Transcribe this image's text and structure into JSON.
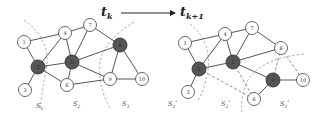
{
  "title_left": {
    "main": "t",
    "sub": "k"
  },
  "title_right": {
    "main": "t",
    "sub": "k+1"
  },
  "colors": {
    "dark_node": "#555555",
    "light_node": "#ffffff",
    "edge": "#444444"
  },
  "left_graph": {
    "nodes": [
      {
        "id": "1",
        "x": 24,
        "y": 42,
        "dark": false
      },
      {
        "id": "4",
        "x": 65,
        "y": 33,
        "dark": false
      },
      {
        "id": "7",
        "x": 90,
        "y": 25,
        "dark": false
      },
      {
        "id": "8",
        "x": 120,
        "y": 45,
        "dark": true
      },
      {
        "id": "2",
        "x": 38,
        "y": 67,
        "dark": true
      },
      {
        "id": "5",
        "x": 72,
        "y": 62,
        "dark": true
      },
      {
        "id": "3",
        "x": 25,
        "y": 90,
        "dark": false
      },
      {
        "id": "6",
        "x": 67,
        "y": 85,
        "dark": false
      },
      {
        "id": "9",
        "x": 110,
        "y": 79,
        "dark": false
      },
      {
        "id": "10",
        "x": 142,
        "y": 79,
        "dark": false
      }
    ],
    "sets": [
      {
        "label": "S",
        "sub": "1",
        "x": 36,
        "y": 108
      },
      {
        "label": "S",
        "sub": "2",
        "x": 73,
        "y": 106
      },
      {
        "label": "S",
        "sub": "3",
        "x": 122,
        "y": 106
      }
    ]
  },
  "right_graph": {
    "nodes": [
      {
        "id": "1",
        "x": 185,
        "y": 43,
        "dark": false
      },
      {
        "id": "4",
        "x": 225,
        "y": 34,
        "dark": false
      },
      {
        "id": "7",
        "x": 252,
        "y": 28,
        "dark": false
      },
      {
        "id": "8",
        "x": 281,
        "y": 48,
        "dark": false
      },
      {
        "id": "2",
        "x": 199,
        "y": 69,
        "dark": true
      },
      {
        "id": "5",
        "x": 233,
        "y": 62,
        "dark": true
      },
      {
        "id": "9",
        "x": 273,
        "y": 80,
        "dark": true
      },
      {
        "id": "10",
        "x": 303,
        "y": 80,
        "dark": false
      },
      {
        "id": "3",
        "x": 188,
        "y": 92,
        "dark": false
      },
      {
        "id": "6",
        "x": 254,
        "y": 99,
        "dark": false
      }
    ],
    "sets": [
      {
        "label": "S",
        "sub": "1",
        "prime": "'",
        "x": 168,
        "y": 106
      },
      {
        "label": "S",
        "sub": "2",
        "prime": "'",
        "x": 221,
        "y": 106
      },
      {
        "label": "S",
        "sub": "3",
        "prime": "'",
        "x": 280,
        "y": 106
      }
    ]
  }
}
